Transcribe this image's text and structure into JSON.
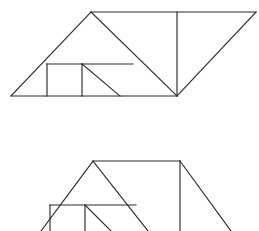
{
  "canvas": {
    "width": 259,
    "height": 231,
    "background_color": "#ffffff",
    "line_color": "#2b2b2b",
    "line_width": 1.15
  },
  "figures": [
    {
      "name": "top-figure",
      "description": "parallelogram dissection with internal square and triangles",
      "segments": [
        {
          "name": "bottom-edge-left",
          "x1": 11,
          "y1": 96,
          "x2": 177,
          "y2": 96
        },
        {
          "name": "left-slope-up",
          "x1": 11,
          "y1": 96,
          "x2": 91,
          "y2": 12
        },
        {
          "name": "top-edge",
          "x1": 91,
          "y1": 12,
          "x2": 256,
          "y2": 12
        },
        {
          "name": "right-slope-down",
          "x1": 256,
          "y1": 12,
          "x2": 177,
          "y2": 96
        },
        {
          "name": "apex-to-bottom-diagonal",
          "x1": 91,
          "y1": 12,
          "x2": 177,
          "y2": 96
        },
        {
          "name": "mid-horizontal",
          "x1": 47,
          "y1": 64,
          "x2": 133,
          "y2": 64
        },
        {
          "name": "square-left-vertical",
          "x1": 47,
          "y1": 64,
          "x2": 47,
          "y2": 96
        },
        {
          "name": "square-right-vertical",
          "x1": 82,
          "y1": 64,
          "x2": 82,
          "y2": 96
        },
        {
          "name": "inner-diagonal",
          "x1": 82,
          "y1": 64,
          "x2": 120,
          "y2": 96
        },
        {
          "name": "right-vertical",
          "x1": 177,
          "y1": 12,
          "x2": 177,
          "y2": 96
        }
      ]
    },
    {
      "name": "bottom-figure",
      "description": "partially cropped triangle dissection repeating the upper motif",
      "segments": [
        {
          "name": "left-slope-up",
          "x1": 41,
          "y1": 231,
          "x2": 93,
          "y2": 161
        },
        {
          "name": "top-edge",
          "x1": 93,
          "y1": 161,
          "x2": 180,
          "y2": 161
        },
        {
          "name": "right-slope-down",
          "x1": 180,
          "y1": 161,
          "x2": 231,
          "y2": 231
        },
        {
          "name": "apex-inner-diagonal",
          "x1": 93,
          "y1": 161,
          "x2": 148,
          "y2": 231
        },
        {
          "name": "mid-horizontal",
          "x1": 50,
          "y1": 205,
          "x2": 136,
          "y2": 205
        },
        {
          "name": "square-left-vertical",
          "x1": 50,
          "y1": 205,
          "x2": 50,
          "y2": 231
        },
        {
          "name": "square-right-vertical",
          "x1": 85,
          "y1": 205,
          "x2": 85,
          "y2": 231
        },
        {
          "name": "inner-diagonal",
          "x1": 85,
          "y1": 205,
          "x2": 111,
          "y2": 231
        },
        {
          "name": "right-vertical",
          "x1": 180,
          "y1": 161,
          "x2": 180,
          "y2": 231
        }
      ]
    }
  ]
}
